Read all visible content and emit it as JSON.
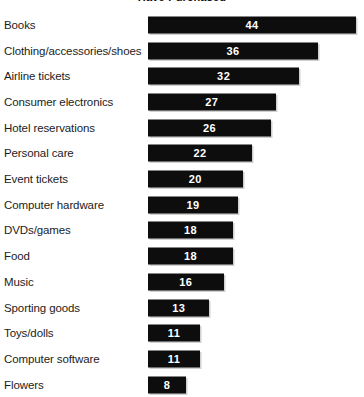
{
  "chart_data": {
    "type": "bar",
    "orientation": "horizontal",
    "title": "Have Purchased",
    "title_clipped": true,
    "xlabel": "",
    "ylabel": "",
    "xlim": [
      0,
      44
    ],
    "grid": false,
    "legend": null,
    "value_labels_inside_bars": true,
    "bar_color": "#0d0d0d",
    "value_label_color": "#ffffff",
    "background_color": "#ffffff",
    "categories": [
      "Books",
      "Clothing/accessories/shoes",
      "Airline tickets",
      "Consumer electronics",
      "Hotel reservations",
      "Personal care",
      "Event tickets",
      "Computer hardware",
      "DVDs/games",
      "Food",
      "Music",
      "Sporting goods",
      "Toys/dolls",
      "Computer software",
      "Flowers"
    ],
    "values": [
      44,
      36,
      32,
      27,
      26,
      22,
      20,
      19,
      18,
      18,
      16,
      13,
      11,
      11,
      8
    ]
  }
}
